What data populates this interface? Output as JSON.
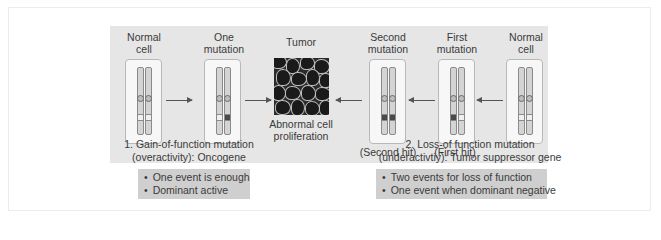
{
  "gain_of_function": {
    "stages": [
      {
        "label_line1": "Normal",
        "label_line2": "cell",
        "mutated_bands": [
          false,
          false
        ]
      },
      {
        "label_line1": "One",
        "label_line2": "mutation",
        "mutated_bands": [
          false,
          true
        ]
      }
    ],
    "caption_line1": "1. Gain-of-function mutation",
    "caption_line2": "(overactivity): Oncogene",
    "bullets": [
      "One event is enough",
      "Dominant active"
    ]
  },
  "tumor": {
    "title": "Tumor",
    "caption_line1": "Abnormal cell",
    "caption_line2": "proliferation"
  },
  "loss_of_function": {
    "stages": [
      {
        "label_line1": "Second",
        "label_line2": "mutation",
        "hit_label": "(Second hit)",
        "mutated_bands": [
          true,
          true
        ]
      },
      {
        "label_line1": "First",
        "label_line2": "mutation",
        "hit_label": "(First hit)",
        "mutated_bands": [
          true,
          false
        ]
      },
      {
        "label_line1": "Normal",
        "label_line2": "cell",
        "hit_label": "",
        "mutated_bands": [
          false,
          false
        ]
      }
    ],
    "caption_line1": "2. Loss-of function mutation",
    "caption_line2": "(underactivtiy): Tumor suppressor gene",
    "bullets": [
      "Two events for loss of function",
      "One event when dominant negative"
    ]
  },
  "colors": {
    "panel": "#e6e6e6",
    "bullet_box": "#cfcfcf",
    "mutation_band": "#4a4a4a"
  }
}
